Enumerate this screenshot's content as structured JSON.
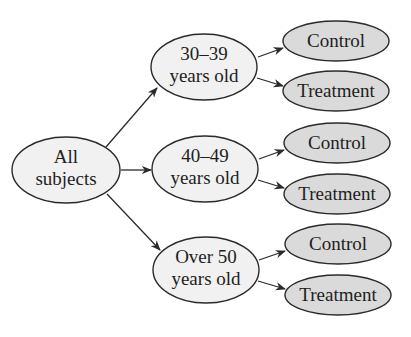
{
  "diagram": {
    "type": "tree",
    "direction": "left-to-right",
    "colors": {
      "stroke": "#2a2a2a",
      "light_fill": "#f1f1f1",
      "dark_fill": "#dadada",
      "text": "#1e1e1e"
    },
    "root": {
      "line1": "All",
      "line2": "subjects"
    },
    "groups": [
      {
        "line1": "30–39",
        "line2": "years old",
        "children": [
          {
            "label": "Control"
          },
          {
            "label": "Treatment"
          }
        ]
      },
      {
        "line1": "40–49",
        "line2": "years old",
        "children": [
          {
            "label": "Control"
          },
          {
            "label": "Treatment"
          }
        ]
      },
      {
        "line1": "Over 50",
        "line2": "years old",
        "children": [
          {
            "label": "Control"
          },
          {
            "label": "Treatment"
          }
        ]
      }
    ]
  }
}
